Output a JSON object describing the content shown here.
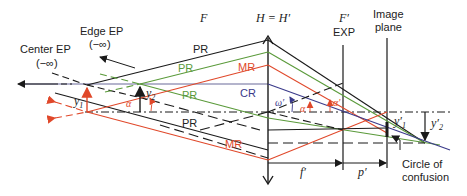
{
  "labels": {
    "center_ep": "Center EP",
    "center_ep_inf": "(−∞)",
    "edge_ep": "Edge EP",
    "edge_ep_inf": "(−∞)",
    "focal_front": "F",
    "principal_planes": "H = H′",
    "focal_back": "F′",
    "exit_pupil": "EXP",
    "image_plane_line1": "Image",
    "image_plane_line2": "plane",
    "pr_black_top": "PR",
    "pr_green_top": "PR",
    "mr_red_top": "MR",
    "pr_green_mid": "PR",
    "cr": "CR",
    "pr_black_bottom": "PR",
    "mr_red_bottom": "MR",
    "y1": "y",
    "y1_sub": "1",
    "y2": "y",
    "y2_sub": "2",
    "alpha_obj": "α",
    "omega_prime": "ω′",
    "alpha_img1": "α",
    "alpha_img2": "α′",
    "y1_prime": "y′",
    "y1_prime_sub": "1",
    "y2_prime": "y′",
    "y2_prime_sub": "2",
    "f_prime": "f′",
    "p_prime": "p′",
    "coc_line1": "Circle of",
    "coc_line2": "confusion"
  },
  "colors": {
    "black": "#1a1a1a",
    "green": "#5a9a3a",
    "red": "#e0482a",
    "blue": "#3a3a8a",
    "cr_line": "#6a6a9a"
  }
}
